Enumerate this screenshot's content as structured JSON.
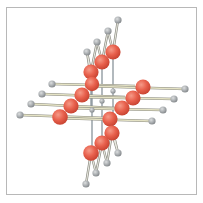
{
  "figure": {
    "colors": {
      "frame_border": "#b8b8b8",
      "atom_large": "#e8604c",
      "atom_large_highlight": "#f59a88",
      "atom_small": "#a9adb0",
      "atom_small_highlight": "#d8dadc",
      "bond_light": "#e4e2c4",
      "bond_outline": "#8a8a80",
      "bond_vertical": "#7f8a92"
    },
    "atoms_large": [
      {
        "x": 113,
        "y": 52
      },
      {
        "x": 102,
        "y": 62
      },
      {
        "x": 91,
        "y": 72
      },
      {
        "x": 92,
        "y": 84
      },
      {
        "x": 82,
        "y": 95
      },
      {
        "x": 71,
        "y": 106
      },
      {
        "x": 60,
        "y": 117
      },
      {
        "x": 143,
        "y": 87
      },
      {
        "x": 133,
        "y": 98
      },
      {
        "x": 122,
        "y": 108
      },
      {
        "x": 110,
        "y": 119
      },
      {
        "x": 112,
        "y": 133
      },
      {
        "x": 102,
        "y": 143
      },
      {
        "x": 91,
        "y": 153
      }
    ],
    "atoms_small": [
      {
        "x": 118,
        "y": 20
      },
      {
        "x": 108,
        "y": 31
      },
      {
        "x": 97,
        "y": 42
      },
      {
        "x": 87,
        "y": 52
      },
      {
        "x": 52,
        "y": 84
      },
      {
        "x": 42,
        "y": 94
      },
      {
        "x": 31,
        "y": 104
      },
      {
        "x": 20,
        "y": 115
      },
      {
        "x": 185,
        "y": 89
      },
      {
        "x": 174,
        "y": 99
      },
      {
        "x": 163,
        "y": 110
      },
      {
        "x": 152,
        "y": 121
      },
      {
        "x": 118,
        "y": 153
      },
      {
        "x": 107,
        "y": 163
      },
      {
        "x": 96,
        "y": 173
      },
      {
        "x": 86,
        "y": 184
      },
      {
        "x": 92,
        "y": 110
      },
      {
        "x": 102,
        "y": 101
      },
      {
        "x": 113,
        "y": 91
      }
    ]
  }
}
